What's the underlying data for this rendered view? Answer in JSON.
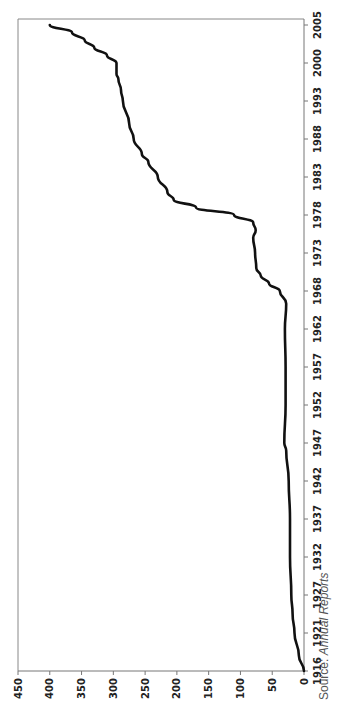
{
  "chart_data": {
    "type": "line",
    "orientation": "rotated-90-clockwise",
    "title": "",
    "xlabel": "",
    "ylabel": "",
    "ylim": [
      0,
      450
    ],
    "yticks": [
      0,
      50,
      100,
      150,
      200,
      250,
      300,
      350,
      400,
      450
    ],
    "xticks": [
      "1916",
      "1921",
      "1927",
      "1932",
      "1937",
      "1942",
      "1947",
      "1952",
      "1957",
      "1962",
      "1968",
      "1973",
      "1978",
      "1983",
      "1988",
      "1993",
      "2000",
      "2005"
    ],
    "grid": false,
    "legend": null,
    "series": [
      {
        "name": "Value",
        "color": "#111111",
        "x": [
          1916,
          1918,
          1921,
          1924,
          1927,
          1932,
          1937,
          1942,
          1946,
          1947,
          1952,
          1957,
          1962,
          1966,
          1968,
          1969,
          1970,
          1971,
          1973,
          1975,
          1976,
          1977,
          1978,
          1979,
          1980,
          1981,
          1983,
          1985,
          1986,
          1988,
          1990,
          1993,
          1995,
          1997,
          1998,
          2000,
          2001,
          2002,
          2003,
          2004,
          2005
        ],
        "values": [
          0,
          8,
          15,
          18,
          20,
          22,
          22,
          24,
          28,
          31,
          29,
          29,
          30,
          28,
          38,
          55,
          68,
          75,
          77,
          80,
          76,
          80,
          110,
          170,
          205,
          215,
          230,
          245,
          255,
          268,
          275,
          285,
          288,
          292,
          295,
          295,
          310,
          330,
          345,
          365,
          400
        ]
      }
    ],
    "source": "Source: Annual Reports"
  },
  "footer": {
    "source_prefix": "Source: ",
    "source_name": "Annual Reports"
  }
}
